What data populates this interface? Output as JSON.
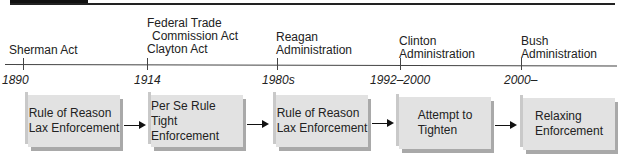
{
  "header": {
    "bar_color": "#111111"
  },
  "timeline": {
    "events": [
      {
        "label_lines": [
          "Sherman Act"
        ],
        "year": "1890"
      },
      {
        "label_lines": [
          "Federal Trade",
          "  Commission Act",
          "Clayton Act"
        ],
        "year": "1914"
      },
      {
        "label_lines": [
          "Reagan",
          "Administration"
        ],
        "year": "1980s"
      },
      {
        "label_lines": [
          "Clinton",
          "Administration"
        ],
        "year": "1992–2000"
      },
      {
        "label_lines": [
          "Bush",
          "Administration"
        ],
        "year": "2000–"
      }
    ]
  },
  "boxes": [
    {
      "line1": "Rule of Reason",
      "line2": "Lax Enforcement"
    },
    {
      "line1": "Per Se Rule",
      "line2": "Tight Enforcement"
    },
    {
      "line1": "Rule of Reason",
      "line2": "Lax Enforcement"
    },
    {
      "line1": "Attempt to",
      "line2": "Tighten"
    },
    {
      "line1": "Relaxing",
      "line2": "Enforcement"
    }
  ],
  "colors": {
    "box_fill": "#e2e2e2",
    "box_shadow": "#a9a9a9",
    "line": "#444444"
  }
}
